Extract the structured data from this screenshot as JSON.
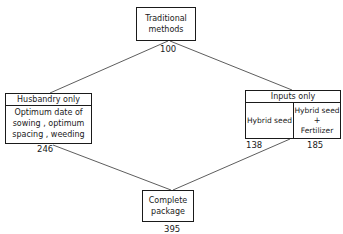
{
  "diagram": {
    "nodes": {
      "traditional": {
        "line1": "Traditional",
        "line2": "methods",
        "value": "100"
      },
      "husbandry": {
        "header": "Husbandry only",
        "line1": "Optimum date of",
        "line2": "sowing , optimum",
        "line3": "spacing , weeding",
        "value": "246"
      },
      "inputs": {
        "header": "Inputs only",
        "left_cell": "Hybrid seed",
        "right_line1": "Hybrid seed",
        "right_plus": "+",
        "right_line2": "Fertilizer",
        "left_value": "138",
        "right_value": "185"
      },
      "complete": {
        "line1": "Complete",
        "line2": "package",
        "value": "395"
      }
    },
    "edges": [
      {
        "from": "traditional",
        "to": "husbandry"
      },
      {
        "from": "traditional",
        "to": "inputs"
      },
      {
        "from": "husbandry",
        "to": "complete"
      },
      {
        "from": "inputs",
        "to": "complete"
      }
    ],
    "colors": {
      "line": "#1a1a1a",
      "background": "#ffffff"
    }
  }
}
